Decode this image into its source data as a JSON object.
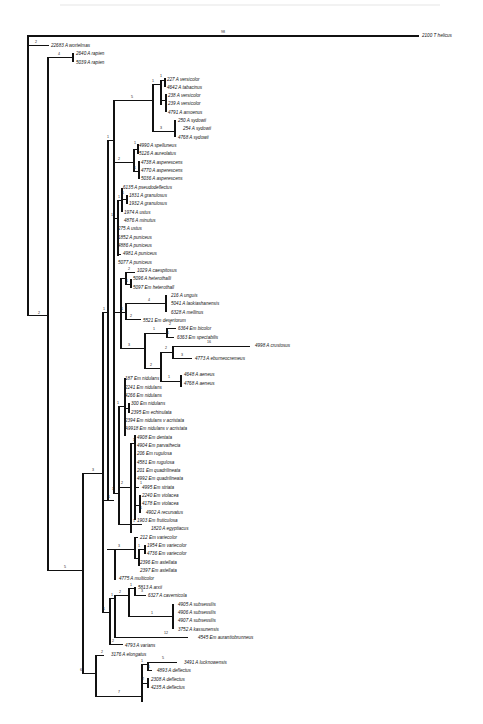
{
  "figure": {
    "type": "phylogenetic-tree",
    "outgroup": {
      "label": "2100 T helicus",
      "branch": "98"
    },
    "taxa": [
      {
        "id": "22683 A wortelmas",
        "y": 45
      },
      {
        "id": "2640 A rapien",
        "y": 53
      },
      {
        "id": "5039 A rapien",
        "y": 62
      },
      {
        "id": "227 A versicolor",
        "y": 79
      },
      {
        "id": "4642 A tabacinus",
        "y": 87
      },
      {
        "id": "238 A versicolor",
        "y": 95
      },
      {
        "id": "239 A versicolor",
        "y": 103
      },
      {
        "id": "4791 A amoenus",
        "y": 112
      },
      {
        "id": "250 A sydowii",
        "y": 120
      },
      {
        "id": "254 A sydowii",
        "y": 128
      },
      {
        "id": "4768 A sydowii",
        "y": 137
      },
      {
        "id": "4990 A spelluneus",
        "y": 145
      },
      {
        "id": "5126 A aureolatus",
        "y": 153
      },
      {
        "id": "4738 A asperescens",
        "y": 162
      },
      {
        "id": "4770 A asperescens",
        "y": 170
      },
      {
        "id": "5036 A asperescens",
        "y": 178
      },
      {
        "id": "6135 A pseudodeflectus",
        "y": 187
      },
      {
        "id": "1831 A granulosus",
        "y": 195
      },
      {
        "id": "1932 A granulosus",
        "y": 203
      },
      {
        "id": "1974 A ustus",
        "y": 212
      },
      {
        "id": "4876 A minutus",
        "y": 220
      },
      {
        "id": "275 A ustus",
        "y": 228
      },
      {
        "id": "1852 A puniceus",
        "y": 237
      },
      {
        "id": "4886 A puniceus",
        "y": 245
      },
      {
        "id": "4981 A puniceus",
        "y": 253
      },
      {
        "id": "5077 A puniceus",
        "y": 262
      },
      {
        "id": "1029 A caespitosus",
        "y": 270
      },
      {
        "id": "5096 A heterothalli",
        "y": 278
      },
      {
        "id": "5097 Em heterothall",
        "y": 287
      },
      {
        "id": "216 A unguis",
        "y": 295
      },
      {
        "id": "5041 A laokiashanensis",
        "y": 303
      },
      {
        "id": "6328 A mellinus",
        "y": 312
      },
      {
        "id": "5521 Em desertorum",
        "y": 320
      },
      {
        "id": "6364 Em bicolor",
        "y": 328
      },
      {
        "id": "6363 Em spectabilis",
        "y": 337
      },
      {
        "id": "4998 A crustosus",
        "y": 341
      },
      {
        "id": "4773 A eburneocremeus",
        "y": 349
      },
      {
        "id": "4648 A aeneus",
        "y": 362
      },
      {
        "id": "4768 A aeneus",
        "y": 370
      },
      {
        "id": "187 Em nidulans",
        "y": 378
      },
      {
        "id": "2241 Em nidulans",
        "y": 387
      },
      {
        "id": "4266 Em nidulans",
        "y": 395
      },
      {
        "id": "300 Em nidulans",
        "y": 403
      },
      {
        "id": "2395 Em echinulata",
        "y": 412
      },
      {
        "id": "2394 Em nidulans v acristata",
        "y": 420
      },
      {
        "id": "A9918 Em nidulans v acristata",
        "y": 428
      },
      {
        "id": "4908 Em dentata",
        "y": 437
      },
      {
        "id": "4904 Em parvathecia",
        "y": 445
      },
      {
        "id": "206 Em rugulosa",
        "y": 453
      },
      {
        "id": "4581 Em rugulosa",
        "y": 462
      },
      {
        "id": "201 Em quadrilineata",
        "y": 470
      },
      {
        "id": "4992 Em quadrilineata",
        "y": 478
      },
      {
        "id": "4995 Em striata",
        "y": 487
      },
      {
        "id": "2240 Em violacea",
        "y": 495
      },
      {
        "id": "4178 Em violacea",
        "y": 503
      },
      {
        "id": "4902 A recurvatus",
        "y": 512
      },
      {
        "id": "1903 Em fruticulosa",
        "y": 520
      },
      {
        "id": "1820 A egyptiacus",
        "y": 528
      },
      {
        "id": "212 Em variecolor",
        "y": 537
      },
      {
        "id": "1954 Em variecolor",
        "y": 545
      },
      {
        "id": "4736 Em variecolor",
        "y": 553
      },
      {
        "id": "2396 Em astellata",
        "y": 562
      },
      {
        "id": "2397 Em astellata",
        "y": 570
      },
      {
        "id": "4775 A multicolor",
        "y": 578
      },
      {
        "id": "5813 A arxii",
        "y": 587
      },
      {
        "id": "6327 A cavernicola",
        "y": 595
      },
      {
        "id": "4905 A subsessilis",
        "y": 604
      },
      {
        "id": "4906 A subsessilis",
        "y": 612
      },
      {
        "id": "4907 A subsessilis",
        "y": 620
      },
      {
        "id": "3752 A kassunensis",
        "y": 629
      },
      {
        "id": "4545 Em aurantiobrunneus",
        "y": 637
      },
      {
        "id": "4793 A varians",
        "y": 645
      },
      {
        "id": "3176 A elongatus",
        "y": 654
      },
      {
        "id": "3491 A lucknowensis",
        "y": 662
      },
      {
        "id": "4893 A deflectus",
        "y": 670
      },
      {
        "id": "2308 A deflectus",
        "y": 679
      },
      {
        "id": "4235 A deflectus",
        "y": 687
      }
    ],
    "branch_labels": [
      "98",
      "2",
      "4",
      "5",
      "1",
      "1",
      "1",
      "2",
      "1",
      "1",
      "1",
      "3",
      "1",
      "1",
      "1",
      "1",
      "2",
      "1",
      "4",
      "2",
      "1",
      "2",
      "1",
      "16",
      "3",
      "2",
      "1",
      "1",
      "3",
      "1",
      "1",
      "2",
      "1",
      "1",
      "3",
      "1",
      "5",
      "6",
      "2",
      "7",
      "5",
      "1",
      "2",
      "1",
      "2",
      "3",
      "1",
      "12",
      "8"
    ]
  },
  "labels": {
    "outgroup": "2100 T helicus",
    "outgroup_branch": "98",
    "t0": "22683 A wortelmas",
    "t1": "2640 A rapien",
    "t2": "5039 A rapien",
    "t3": "227 A versicolor",
    "t4": "4642 A tabacinus",
    "t5": "238 A versicolor",
    "t6": "239 A versicolor",
    "t7": "4791 A amoenus",
    "t8": "250 A sydowii",
    "t9": "254 A sydowii",
    "t10": "4768 A sydowii",
    "t11": "4990 A spelluneus",
    "t12": "5126 A aureolatus",
    "t13": "4738 A asperescens",
    "t14": "4770 A asperescens",
    "t15": "5036 A asperescens",
    "t16": "6135 A pseudodeflectus",
    "t17": "1831 A granulosus",
    "t18": "1932 A granulosus",
    "t19": "1974 A ustus",
    "t20": "4876 A minutus",
    "t21": "275 A ustus",
    "t22": "1852 A puniceus",
    "t23": "4886 A puniceus",
    "t24": "4981 A puniceus",
    "t25": "5077 A puniceus",
    "t26": "1029 A caespitosus",
    "t27": "5096 A heterothalli",
    "t28": "5097 Em heterothall",
    "t29": "216 A unguis",
    "t30": "5041 A laokiashanensis",
    "t31": "6328 A mellinus",
    "t32": "5521 Em desertorum",
    "t33": "6364 Em bicolor",
    "t34": "6363 Em spectabilis",
    "t35": "4998 A crustosus",
    "t36": "4773 A eburneocremeus",
    "t37": "4648 A aeneus",
    "t38": "4768 A aeneus",
    "t39": "187 Em nidulans",
    "t40": "2241 Em nidulans",
    "t41": "4266 Em nidulans",
    "t42": "300 Em nidulans",
    "t43": "2395 Em echinulata",
    "t44": "2394 Em nidulans v acristata",
    "t45": "A9918 Em nidulans v acristata",
    "t46": "4908 Em dentata",
    "t47": "4904 Em parvathecia",
    "t48": "206 Em rugulosa",
    "t49": "4581 Em rugulosa",
    "t50": "201 Em quadrilineata",
    "t51": "4992 Em quadrilineata",
    "t52": "4995 Em striata",
    "t53": "2240 Em violacea",
    "t54": "4178 Em violacea",
    "t55": "4902 A recurvatus",
    "t56": "1903 Em fruticulosa",
    "t57": "1820 A egyptiacus",
    "t58": "212 Em variecolor",
    "t59": "1954 Em variecolor",
    "t60": "4736 Em variecolor",
    "t61": "2396 Em astellata",
    "t62": "2397 Em astellata",
    "t63": "4775 A multicolor",
    "t64": "5813 A arxii",
    "t65": "6327 A cavernicola",
    "t66": "4905 A subsessilis",
    "t67": "4906 A subsessilis",
    "t68": "4907 A subsessilis",
    "t69": "3752 A kassunensis",
    "t70": "4545 Em aurantiobrunneus",
    "t71": "4793 A varians",
    "t72": "3176 A elongatus",
    "t73": "3491 A lucknowensis",
    "t74": "4893 A deflectus",
    "t75": "2308 A deflectus",
    "t76": "4235 A deflectus"
  },
  "bl": {
    "b_wort": "2",
    "b_rap": "4",
    "b_vers_clade": "5",
    "b_vers_a": "1",
    "b_vers_b": "1",
    "b_syd": "3",
    "b_syd2": "1",
    "b_spel": "1",
    "b_asp_outer": "2",
    "b_asp": "1",
    "b_ustus": "1",
    "b_gran": "1",
    "b_gran2": "1",
    "b_pun": "1",
    "b_pun2": "1",
    "b_caes": "2",
    "b_het": "1",
    "b_ung": "4",
    "b_des": "2",
    "b_ungdes": "1",
    "b_ungdes2": "1",
    "b_bic": "2",
    "b_bic1": "1",
    "b_bic2": "1",
    "b_crus": "16",
    "b_ebur": "3",
    "b_crusgrp": "2",
    "b_aen": "1",
    "b_aenout": "2",
    "b_biclade": "3",
    "b_nidout": "1",
    "b_nid": "1",
    "b_vio": "1",
    "b_rugo": "2",
    "b_str": "1",
    "b_rec": "1",
    "b_egy": "1",
    "b_var": "3",
    "b_var1": "1",
    "b_var2": "1",
    "b_mid": "1",
    "b_mid2": "1",
    "b_upper": "1",
    "b_main": "3",
    "b_root": "5",
    "b_arx": "1",
    "b_cav": "3",
    "b_sub": "1",
    "b_sub2": "2",
    "b_subout": "1",
    "b_aur": "12",
    "b_subgrp": "1",
    "b_varians": "2",
    "b_elong": "2",
    "b_luck": "5",
    "b_def1": "1",
    "b_def2": "2",
    "b_defgrp": "1",
    "b_defout": "7",
    "b_bottom": "6",
    "b_low": "2"
  }
}
